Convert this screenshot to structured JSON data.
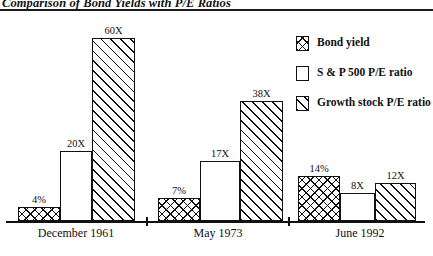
{
  "chart_data": {
    "type": "bar",
    "title": "Comparison of Bond Yields with P/E Ratios",
    "xlabel": "",
    "ylabel": "",
    "grid": false,
    "legend_position": "right",
    "categories": [
      "December 1961",
      "May 1973",
      "June 1992"
    ],
    "series": [
      {
        "name": "Bond yield",
        "pattern": "crosshatch",
        "values": [
          4,
          7,
          14
        ],
        "labels": [
          "4%",
          "7%",
          "14%"
        ]
      },
      {
        "name": "S & P 500 P/E ratio",
        "pattern": "plain",
        "values": [
          20,
          17,
          8
        ],
        "labels": [
          "20X",
          "17X",
          "8X"
        ]
      },
      {
        "name": "Growth stock P/E ratio",
        "pattern": "diagonal",
        "values": [
          60,
          38,
          12
        ],
        "labels": [
          "60X",
          "38X",
          "12X"
        ]
      }
    ],
    "ylim": [
      0,
      60
    ],
    "colors": {
      "ink": "#111111",
      "background": "#ffffff"
    }
  },
  "legend": {
    "items": [
      {
        "label": "Bond yield",
        "pattern": "crosshatch"
      },
      {
        "label": "S & P 500 P/E ratio",
        "pattern": "plain"
      },
      {
        "label": "Growth stock P/E ratio",
        "pattern": "diagonal"
      }
    ]
  },
  "axis": {
    "group_labels": [
      "December 1961",
      "May 1973",
      "June 1992"
    ]
  },
  "bars": [
    {
      "label": "4%",
      "pattern": "cross",
      "x": 18,
      "w": 42,
      "h": 14
    },
    {
      "label": "20X",
      "pattern": "plain",
      "x": 60,
      "w": 32,
      "h": 70
    },
    {
      "label": "60X",
      "pattern": "diag",
      "x": 92,
      "w": 43,
      "h": 183
    },
    {
      "label": "7%",
      "pattern": "cross",
      "x": 158,
      "w": 42,
      "h": 23
    },
    {
      "label": "17X",
      "pattern": "plain",
      "x": 200,
      "w": 40,
      "h": 60
    },
    {
      "label": "38X",
      "pattern": "diag",
      "x": 240,
      "w": 43,
      "h": 120
    },
    {
      "label": "14%",
      "pattern": "cross",
      "x": 298,
      "w": 42,
      "h": 45
    },
    {
      "label": "8X",
      "pattern": "plain",
      "x": 340,
      "w": 35,
      "h": 28
    },
    {
      "label": "12X",
      "pattern": "diag",
      "x": 375,
      "w": 41,
      "h": 38
    }
  ],
  "ticks": [
    {
      "x": 146
    },
    {
      "x": 288
    }
  ],
  "group_label_positions": [
    {
      "x": 76
    },
    {
      "x": 218
    },
    {
      "x": 360
    }
  ]
}
